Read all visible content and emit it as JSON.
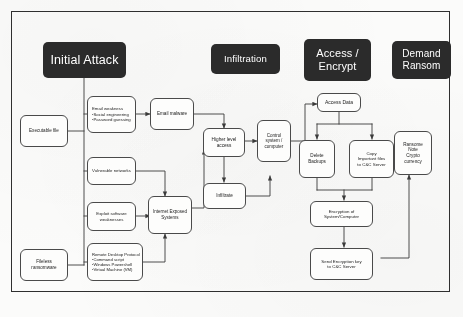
{
  "diagram": {
    "title_note": "Ransomware attack lifecycle flow diagram",
    "colors": {
      "banner_fill": "#2b2b2b",
      "banner_text": "#ffffff",
      "node_fill": "#fdfdfc",
      "node_stroke": "#4a4a4a",
      "frame_stroke": "#2f2f2f",
      "page_bg": "#fbfbfa",
      "connector": "#3a3a3a"
    },
    "phases": [
      {
        "id": "initial-attack",
        "label": "Initial Attack"
      },
      {
        "id": "infiltration",
        "label": "Infiltration"
      },
      {
        "id": "access-encrypt",
        "label": "Access /\nEncrypt",
        "line1": "Access /",
        "line2": "Encrypt"
      },
      {
        "id": "demand-ransom",
        "label": "Demand Ransom",
        "line1": "Demand",
        "line2": "Ransom"
      }
    ],
    "nodes": {
      "executable_file": {
        "label": "Executable file"
      },
      "fileless_ransomware": {
        "label": "Fileless ransomware"
      },
      "email_weakness": {
        "heading": "Email weakness",
        "items": [
          "•Social engineering",
          "•Password guessing"
        ]
      },
      "vulnerable_networks": {
        "label": "Vulnerable networks"
      },
      "exploit_software": {
        "line1": "Exploit software",
        "line2": "weaknesses"
      },
      "remote_desktop": {
        "heading": "Remote Desktop Protocol",
        "items": [
          "•Command  script",
          "•Windows Powershell",
          "•Virtual Machine (VM)"
        ]
      },
      "email_malware": {
        "label": "Email malware"
      },
      "internet_exposed": {
        "line1": "Internet Exposed",
        "line2": "Systems"
      },
      "higher_level_access": {
        "line1": "Higher level",
        "line2": "access"
      },
      "infiltrate": {
        "label": "Infiltrate"
      },
      "control_system": {
        "line1": "Control",
        "line2": "system /",
        "line3": "computer"
      },
      "access_data": {
        "label": "Access Data"
      },
      "delete_backups": {
        "line1": "Delete",
        "line2": "Backups"
      },
      "copy_important_files": {
        "line1": "Copy",
        "line2": "Important files",
        "line3": "to C&C Server"
      },
      "encryption_of_system": {
        "line1": "Encryption of",
        "line2": "System/Computer"
      },
      "send_encryption_key": {
        "line1": "Send Encryption key",
        "line2": "to C&C Server"
      },
      "ransom_note": {
        "line1": "Ransome",
        "line2": "Note",
        "line3": "Crypto",
        "line4": "currency"
      }
    }
  }
}
